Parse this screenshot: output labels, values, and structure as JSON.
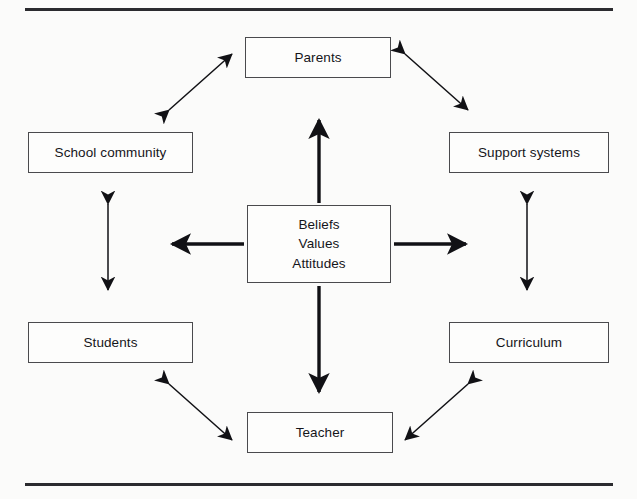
{
  "page": {
    "background_color": "#fbfbfa",
    "rule_color": "#2b2b2f",
    "ink_color": "#15151a",
    "box_border_color": "#4a4a4d"
  },
  "diagram": {
    "center": {
      "id": "core",
      "lines": [
        "Beliefs",
        "Values",
        "Attitudes"
      ]
    },
    "nodes": [
      {
        "id": "parents",
        "label": "Parents"
      },
      {
        "id": "school",
        "label": "School community"
      },
      {
        "id": "support",
        "label": "Support systems"
      },
      {
        "id": "students",
        "label": "Students"
      },
      {
        "id": "curriculum",
        "label": "Curriculum"
      },
      {
        "id": "teacher",
        "label": "Teacher"
      }
    ],
    "connections": [
      {
        "from": "core",
        "to": "parents",
        "style": "thick",
        "heads": "single-up"
      },
      {
        "from": "core",
        "to": "teacher",
        "style": "thick",
        "heads": "single-down"
      },
      {
        "from": "core",
        "to": "left",
        "style": "thick",
        "heads": "single-left"
      },
      {
        "from": "core",
        "to": "right",
        "style": "thick",
        "heads": "single-right"
      },
      {
        "from": "school",
        "to": "students",
        "style": "thin",
        "heads": "double-vertical"
      },
      {
        "from": "support",
        "to": "curriculum",
        "style": "thin",
        "heads": "double-vertical"
      },
      {
        "from": "school",
        "to": "parents",
        "style": "thin",
        "heads": "double-diagonal"
      },
      {
        "from": "parents",
        "to": "support",
        "style": "thin",
        "heads": "double-diagonal"
      },
      {
        "from": "students",
        "to": "teacher",
        "style": "thin",
        "heads": "double-diagonal"
      },
      {
        "from": "teacher",
        "to": "curriculum",
        "style": "thin",
        "heads": "double-diagonal"
      }
    ]
  }
}
